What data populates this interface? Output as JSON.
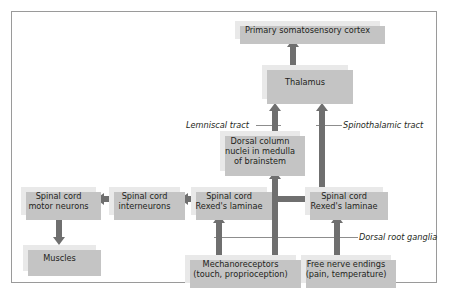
{
  "figure": {
    "colors": {
      "box_fill": "#e9e9e9",
      "box_shadow": "#c4c4c4",
      "arrow": "#6f6f6f",
      "frame_border": "#9a9a9a",
      "text": "#231f20",
      "background": "#ffffff"
    }
  },
  "nodes": [
    {
      "id": "cortex",
      "label": "Primary somatosensory cortex"
    },
    {
      "id": "thalamus",
      "label": "Thalamus"
    },
    {
      "id": "dorsal_column",
      "line1": "Dorsal column",
      "line2": "nuclei in medulla",
      "line3": "of brainstem"
    },
    {
      "id": "motor_neurons",
      "line1": "Spinal cord",
      "line2": "motor neurons"
    },
    {
      "id": "interneurons",
      "line1": "Spinal cord",
      "line2": "interneurons"
    },
    {
      "id": "rexed_left",
      "line1": "Spinal cord",
      "line2": "Rexed's laminae"
    },
    {
      "id": "rexed_right",
      "line1": "Spinal cord",
      "line2": "Rexed's laminae"
    },
    {
      "id": "muscles",
      "label": "Muscles"
    },
    {
      "id": "mechanoreceptors",
      "line1": "Mechanoreceptors",
      "line2": "(touch, proprioception)"
    },
    {
      "id": "free_nerve",
      "line1": "Free nerve endings",
      "line2": "(pain, temperature)"
    }
  ],
  "annotations": [
    {
      "id": "lemniscal",
      "label": "Lemniscal tract"
    },
    {
      "id": "spinothalamic",
      "label": "Spinothalamic tract"
    },
    {
      "id": "dorsal_root_ganglia",
      "label": "Dorsal root ganglia"
    }
  ]
}
